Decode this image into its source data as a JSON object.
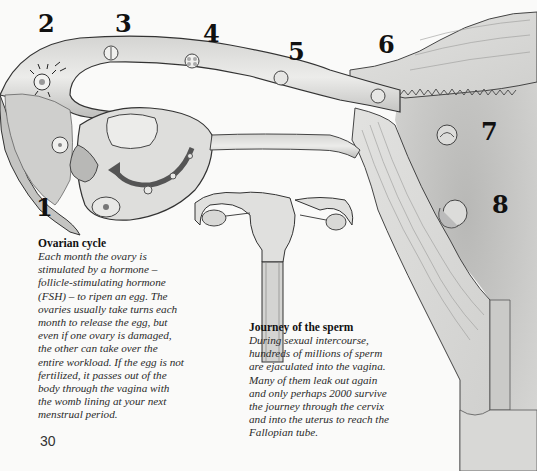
{
  "illustration": {
    "subject": "female reproductive tract – ovary, Fallopian tube and uterus",
    "labels": [
      "1",
      "2",
      "3",
      "4",
      "5",
      "6",
      "7",
      "8"
    ]
  },
  "captions": {
    "ovarian_cycle": {
      "title": "Ovarian cycle",
      "lines": [
        "Each month the ovary is",
        "stimulated by a hormone –",
        "follicle-stimulating hormone",
        "(FSH) – to ripen an egg. The",
        "ovaries usually take turns each",
        "month to release the egg, but",
        "even if one ovary is damaged,",
        "the other can take over the",
        "entire workload. If the egg is not",
        "fertilized, it passes out of the",
        "body through the vagina with",
        "the womb lining at your next",
        "menstrual period."
      ]
    },
    "journey_of_sperm": {
      "title": "Journey of the sperm",
      "lines": [
        "During sexual intercourse,",
        "hundreds of millions of sperm",
        "are ejaculated into the vagina.",
        "Many of them leak out again",
        "and only perhaps 2000 survive",
        "the journey through the cervix",
        "and into the uterus to reach the",
        "Fallopian tube."
      ]
    }
  },
  "page_number": "30"
}
